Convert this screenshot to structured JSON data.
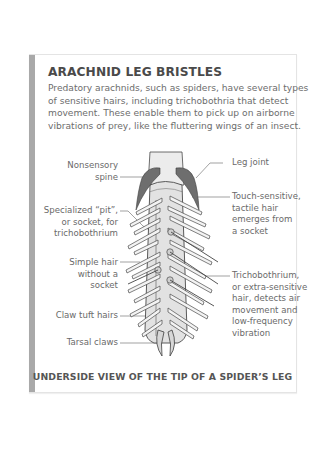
{
  "panel": {
    "title": "ARACHNID LEG BRISTLES",
    "intro_lines": [
      "Predatory arachnids, such as spiders, have several types",
      "of sensitive hairs, including trichobothria that detect",
      "movement. These enable them to pick up on airborne",
      "vibrations of prey, like the fluttering wings of an insect."
    ],
    "accent_bar_color": "#a9a9a9"
  },
  "labels_left": [
    {
      "id": "nonsensory-spine",
      "lines": [
        "Nonsensory",
        "spine"
      ]
    },
    {
      "id": "specialized-pit",
      "lines": [
        "Specialized “pit”,",
        "or socket, for",
        "trichobothrium"
      ]
    },
    {
      "id": "simple-hair",
      "lines": [
        "Simple hair",
        "without a",
        "socket"
      ]
    },
    {
      "id": "claw-tuft-hairs",
      "lines": [
        "Claw tuft hairs"
      ]
    },
    {
      "id": "tarsal-claws",
      "lines": [
        "Tarsal claws"
      ]
    }
  ],
  "labels_right": [
    {
      "id": "leg-joint",
      "lines": [
        "Leg joint"
      ]
    },
    {
      "id": "tactile-hair",
      "lines": [
        "Touch-sensitive,",
        "tactile hair",
        "emerges from",
        "a socket"
      ]
    },
    {
      "id": "trichobothrium",
      "lines": [
        "Trichobothrium,",
        "or extra-sensitive",
        "hair, detects air",
        "movement and",
        "low-frequency",
        "vibration"
      ]
    }
  ],
  "caption": "UNDERSIDE VIEW OF THE TIP OF A SPIDER’S LEG",
  "colors": {
    "leg_fill": "#e2e2e2",
    "leg_outline": "#4a4a4a",
    "spine_fill": "#6e6e6e",
    "leader_line": "#7a7a7a"
  }
}
